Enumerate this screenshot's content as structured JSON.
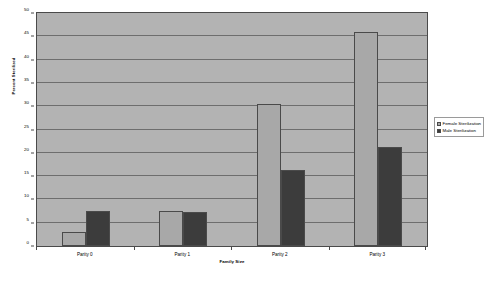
{
  "chart_data": {
    "type": "bar",
    "title": "",
    "xlabel": "Family Size",
    "ylabel": "Percent Sterilized",
    "categories": [
      "Parity 0",
      "Parity 1",
      "Parity 2",
      "Parity 3"
    ],
    "series": [
      {
        "name": "Female Sterilization",
        "color": "#a8a8a8",
        "values": [
          3,
          7.5,
          30.5,
          46
        ]
      },
      {
        "name": "Male Sterilization",
        "color": "#3c3c3c",
        "values": [
          7.5,
          7.2,
          16.3,
          21.2
        ]
      }
    ],
    "ylim": [
      0,
      50
    ],
    "ytick_step": 5,
    "yticks": [
      0,
      5,
      10,
      15,
      20,
      25,
      30,
      35,
      40,
      45,
      50
    ],
    "ytick_labels": [
      "0",
      "5",
      "10",
      "15",
      "20",
      "25",
      "30",
      "35",
      "40",
      "45",
      "50"
    ],
    "grid": true,
    "grid_axis": "y",
    "legend_position": "right",
    "plot_background": "#b3b3b3",
    "figure_background": "#ffffff",
    "axis_color": "#4a4a4a",
    "gridline_color": "#6e6e6e"
  },
  "legend": {
    "items": [
      {
        "label": "Female Sterilization",
        "swatch": "female"
      },
      {
        "label": "Male Sterilization",
        "swatch": "male"
      }
    ]
  }
}
